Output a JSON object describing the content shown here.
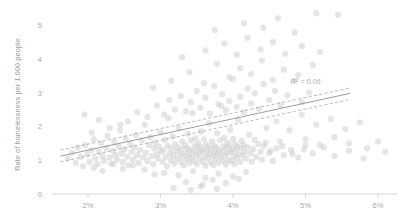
{
  "chart_data": {
    "type": "scatter",
    "title": "",
    "xlabel": "",
    "ylabel": "Rate of homelessness per 1,000 people",
    "xlim": [
      1.55,
      6.35
    ],
    "ylim": [
      0,
      5.55
    ],
    "grid": false,
    "legend": null,
    "xtick_labels": [
      "2%",
      "3%",
      "4%",
      "5%",
      "6%"
    ],
    "xtick_values": [
      2,
      3,
      4,
      5,
      6
    ],
    "ytick_labels": [
      "0",
      "1",
      "2",
      "3",
      "4",
      "5"
    ],
    "ytick_values": [
      0,
      1,
      2,
      3,
      4,
      5
    ],
    "annotations": [
      {
        "text": "R² = 0.06",
        "x": 5.0,
        "y": 3.25
      }
    ],
    "trendline": {
      "type": "linear-fit",
      "r_squared": 0.06,
      "x_start": 1.62,
      "x_end": 5.62,
      "y_start": 1.12,
      "y_end": 2.98,
      "confidence_bands": [
        {
          "name": "upper",
          "x_start": 1.62,
          "y_start": 1.3,
          "x_end": 5.62,
          "y_end": 3.14
        },
        {
          "name": "lower",
          "x_start": 1.62,
          "y_start": 0.95,
          "x_end": 5.62,
          "y_end": 2.8
        }
      ]
    },
    "marker": {
      "shape": "circle",
      "color": "#cfcfcf",
      "opacity": 0.55,
      "radius": 3.1
    },
    "points": [
      [
        1.72,
        1.05
      ],
      [
        1.78,
        1.22
      ],
      [
        1.83,
        0.92
      ],
      [
        1.86,
        1.38
      ],
      [
        1.9,
        1.1
      ],
      [
        1.93,
        0.82
      ],
      [
        1.96,
        1.45
      ],
      [
        1.99,
        1.18
      ],
      [
        2.02,
        0.95
      ],
      [
        2.05,
        1.3
      ],
      [
        2.08,
        1.62
      ],
      [
        2.1,
        1.05
      ],
      [
        2.13,
        0.88
      ],
      [
        2.15,
        1.25
      ],
      [
        2.18,
        1.5
      ],
      [
        2.2,
        1.12
      ],
      [
        2.22,
        0.98
      ],
      [
        2.25,
        1.35
      ],
      [
        2.27,
        1.72
      ],
      [
        2.3,
        1.08
      ],
      [
        2.32,
        0.9
      ],
      [
        2.34,
        1.28
      ],
      [
        2.36,
        1.55
      ],
      [
        2.38,
        1.15
      ],
      [
        2.4,
        1.02
      ],
      [
        2.42,
        1.42
      ],
      [
        2.44,
        1.88
      ],
      [
        2.46,
        1.2
      ],
      [
        2.48,
        0.95
      ],
      [
        2.5,
        1.32
      ],
      [
        2.52,
        1.65
      ],
      [
        2.54,
        1.1
      ],
      [
        2.56,
        0.85
      ],
      [
        2.58,
        1.48
      ],
      [
        2.6,
        1.25
      ],
      [
        2.62,
        1.02
      ],
      [
        2.64,
        1.38
      ],
      [
        2.66,
        1.75
      ],
      [
        2.68,
        1.15
      ],
      [
        2.7,
        0.92
      ],
      [
        2.72,
        1.3
      ],
      [
        2.74,
        1.58
      ],
      [
        2.76,
        1.08
      ],
      [
        2.78,
        2.05
      ],
      [
        2.8,
        1.22
      ],
      [
        2.82,
        0.98
      ],
      [
        2.84,
        1.45
      ],
      [
        2.86,
        1.68
      ],
      [
        2.88,
        1.12
      ],
      [
        2.9,
        0.88
      ],
      [
        2.91,
        1.35
      ],
      [
        2.93,
        1.52
      ],
      [
        2.95,
        1.18
      ],
      [
        2.96,
        1.05
      ],
      [
        2.98,
        1.4
      ],
      [
        3.0,
        1.82
      ],
      [
        3.01,
        1.25
      ],
      [
        3.03,
        0.95
      ],
      [
        3.04,
        1.3
      ],
      [
        3.06,
        1.6
      ],
      [
        3.07,
        1.1
      ],
      [
        3.09,
        0.82
      ],
      [
        3.1,
        1.42
      ],
      [
        3.11,
        2.25
      ],
      [
        3.13,
        1.2
      ],
      [
        3.14,
        1.0
      ],
      [
        3.15,
        1.35
      ],
      [
        3.17,
        1.7
      ],
      [
        3.18,
        1.15
      ],
      [
        3.19,
        0.9
      ],
      [
        3.2,
        1.48
      ],
      [
        3.22,
        1.28
      ],
      [
        3.23,
        1.05
      ],
      [
        3.24,
        1.38
      ],
      [
        3.25,
        1.95
      ],
      [
        3.27,
        1.18
      ],
      [
        3.28,
        0.95
      ],
      [
        3.29,
        1.32
      ],
      [
        3.3,
        1.55
      ],
      [
        3.31,
        1.12
      ],
      [
        3.32,
        0.85
      ],
      [
        3.34,
        1.44
      ],
      [
        3.35,
        1.22
      ],
      [
        3.36,
        1.02
      ],
      [
        3.37,
        1.36
      ],
      [
        3.38,
        1.78
      ],
      [
        3.39,
        1.14
      ],
      [
        3.4,
        0.92
      ],
      [
        3.41,
        1.3
      ],
      [
        3.42,
        1.58
      ],
      [
        3.43,
        1.08
      ],
      [
        3.44,
        2.4
      ],
      [
        3.45,
        1.25
      ],
      [
        3.46,
        0.98
      ],
      [
        3.47,
        1.42
      ],
      [
        3.48,
        1.65
      ],
      [
        3.49,
        1.16
      ],
      [
        3.5,
        0.88
      ],
      [
        3.51,
        1.34
      ],
      [
        3.52,
        1.5
      ],
      [
        3.53,
        1.2
      ],
      [
        3.54,
        1.04
      ],
      [
        3.55,
        1.4
      ],
      [
        3.56,
        1.85
      ],
      [
        3.57,
        1.24
      ],
      [
        3.58,
        0.96
      ],
      [
        3.59,
        1.31
      ],
      [
        3.6,
        1.62
      ],
      [
        3.61,
        1.11
      ],
      [
        3.62,
        0.84
      ],
      [
        3.63,
        1.46
      ],
      [
        3.64,
        1.26
      ],
      [
        3.65,
        1.06
      ],
      [
        3.66,
        1.39
      ],
      [
        3.67,
        2.1
      ],
      [
        3.68,
        1.19
      ],
      [
        3.69,
        0.94
      ],
      [
        3.7,
        1.33
      ],
      [
        3.71,
        1.56
      ],
      [
        3.72,
        1.13
      ],
      [
        3.73,
        0.86
      ],
      [
        3.74,
        1.43
      ],
      [
        3.75,
        1.23
      ],
      [
        3.76,
        1.03
      ],
      [
        3.77,
        1.37
      ],
      [
        3.78,
        1.8
      ],
      [
        3.79,
        1.17
      ],
      [
        3.8,
        0.93
      ],
      [
        3.81,
        1.29
      ],
      [
        3.82,
        1.59
      ],
      [
        3.83,
        1.09
      ],
      [
        3.84,
        2.6
      ],
      [
        3.85,
        1.27
      ],
      [
        3.86,
        0.99
      ],
      [
        3.87,
        1.41
      ],
      [
        3.88,
        1.66
      ],
      [
        3.89,
        1.15
      ],
      [
        3.9,
        0.87
      ],
      [
        3.91,
        1.35
      ],
      [
        3.92,
        1.51
      ],
      [
        3.93,
        1.21
      ],
      [
        3.94,
        1.01
      ],
      [
        3.95,
        1.45
      ],
      [
        3.96,
        1.9
      ],
      [
        3.97,
        1.25
      ],
      [
        3.98,
        0.97
      ],
      [
        3.99,
        1.32
      ],
      [
        4.0,
        1.63
      ],
      [
        4.01,
        1.12
      ],
      [
        4.02,
        0.89
      ],
      [
        4.03,
        1.47
      ],
      [
        4.04,
        1.28
      ],
      [
        4.05,
        1.07
      ],
      [
        4.06,
        1.4
      ],
      [
        4.07,
        2.2
      ],
      [
        4.08,
        1.18
      ],
      [
        4.1,
        0.95
      ],
      [
        4.11,
        1.36
      ],
      [
        4.12,
        1.57
      ],
      [
        4.13,
        1.14
      ],
      [
        4.15,
        1.44
      ],
      [
        4.16,
        1.24
      ],
      [
        4.18,
        1.05
      ],
      [
        4.2,
        1.38
      ],
      [
        4.22,
        1.75
      ],
      [
        4.24,
        1.2
      ],
      [
        4.26,
        0.96
      ],
      [
        4.28,
        1.33
      ],
      [
        4.3,
        1.6
      ],
      [
        4.32,
        1.1
      ],
      [
        4.35,
        1.48
      ],
      [
        4.38,
        1.26
      ],
      [
        4.4,
        1.02
      ],
      [
        4.43,
        1.42
      ],
      [
        4.46,
        1.95
      ],
      [
        4.5,
        1.22
      ],
      [
        4.55,
        0.98
      ],
      [
        4.6,
        1.35
      ],
      [
        4.65,
        1.55
      ],
      [
        4.7,
        1.15
      ],
      [
        4.8,
        1.3
      ],
      [
        4.9,
        1.08
      ],
      [
        5.0,
        1.45
      ],
      [
        5.1,
        1.2
      ],
      [
        5.25,
        1.38
      ],
      [
        5.4,
        1.12
      ],
      [
        5.6,
        1.28
      ],
      [
        5.8,
        1.05
      ],
      [
        2.55,
        2.15
      ],
      [
        2.68,
        2.42
      ],
      [
        2.82,
        2.28
      ],
      [
        2.95,
        2.62
      ],
      [
        3.05,
        2.35
      ],
      [
        3.12,
        2.78
      ],
      [
        3.2,
        2.5
      ],
      [
        3.28,
        2.9
      ],
      [
        3.35,
        2.45
      ],
      [
        3.42,
        2.72
      ],
      [
        3.5,
        3.05
      ],
      [
        3.55,
        2.55
      ],
      [
        3.62,
        2.85
      ],
      [
        3.68,
        2.38
      ],
      [
        3.74,
        3.2
      ],
      [
        3.8,
        2.65
      ],
      [
        3.85,
        2.95
      ],
      [
        3.9,
        2.48
      ],
      [
        3.95,
        2.75
      ],
      [
        4.0,
        3.4
      ],
      [
        4.05,
        2.58
      ],
      [
        4.1,
        2.88
      ],
      [
        4.15,
        2.42
      ],
      [
        4.2,
        3.12
      ],
      [
        4.25,
        2.68
      ],
      [
        4.3,
        2.98
      ],
      [
        4.36,
        2.52
      ],
      [
        4.42,
        3.25
      ],
      [
        4.5,
        2.78
      ],
      [
        4.58,
        3.05
      ],
      [
        4.66,
        2.62
      ],
      [
        4.75,
        2.92
      ],
      [
        4.85,
        3.35
      ],
      [
        4.95,
        2.72
      ],
      [
        5.05,
        3.0
      ],
      [
        2.9,
        3.15
      ],
      [
        3.15,
        3.35
      ],
      [
        3.4,
        3.6
      ],
      [
        3.6,
        3.28
      ],
      [
        3.78,
        3.85
      ],
      [
        3.95,
        3.45
      ],
      [
        4.1,
        3.72
      ],
      [
        4.25,
        3.55
      ],
      [
        4.4,
        3.95
      ],
      [
        4.55,
        3.38
      ],
      [
        4.7,
        3.68
      ],
      [
        4.9,
        3.52
      ],
      [
        5.1,
        3.82
      ],
      [
        3.3,
        4.05
      ],
      [
        3.62,
        4.25
      ],
      [
        3.88,
        4.45
      ],
      [
        4.05,
        4.12
      ],
      [
        4.2,
        4.62
      ],
      [
        4.38,
        4.28
      ],
      [
        4.55,
        4.5
      ],
      [
        4.72,
        4.15
      ],
      [
        4.95,
        4.38
      ],
      [
        5.2,
        4.2
      ],
      [
        3.75,
        4.85
      ],
      [
        4.15,
        5.05
      ],
      [
        4.42,
        4.92
      ],
      [
        4.62,
        5.2
      ],
      [
        4.85,
        4.78
      ],
      [
        5.15,
        5.35
      ],
      [
        5.45,
        5.3
      ],
      [
        2.45,
        2.05
      ],
      [
        2.3,
        1.95
      ],
      [
        2.15,
        2.2
      ],
      [
        2.05,
        1.82
      ],
      [
        1.95,
        2.35
      ],
      [
        4.6,
        2.15
      ],
      [
        4.78,
        1.88
      ],
      [
        4.95,
        2.35
      ],
      [
        5.15,
        2.05
      ],
      [
        5.35,
        2.22
      ],
      [
        5.55,
        1.92
      ],
      [
        5.75,
        2.12
      ],
      [
        3.05,
        0.62
      ],
      [
        3.25,
        0.55
      ],
      [
        3.45,
        0.68
      ],
      [
        3.62,
        0.48
      ],
      [
        3.8,
        0.6
      ],
      [
        4.0,
        0.52
      ],
      [
        4.18,
        0.65
      ],
      [
        3.35,
        0.35
      ],
      [
        3.58,
        0.28
      ],
      [
        3.72,
        0.42
      ],
      [
        3.9,
        0.32
      ],
      [
        4.08,
        0.45
      ],
      [
        3.18,
        0.18
      ],
      [
        3.42,
        0.12
      ],
      [
        3.55,
        0.22
      ],
      [
        3.78,
        0.15
      ],
      [
        2.78,
        0.72
      ],
      [
        2.92,
        0.58
      ],
      [
        2.62,
        0.85
      ],
      [
        2.48,
        0.75
      ],
      [
        2.35,
        0.88
      ],
      [
        2.2,
        0.68
      ],
      [
        2.08,
        0.78
      ],
      [
        5.0,
        1.62
      ],
      [
        5.2,
        1.45
      ],
      [
        5.4,
        1.68
      ],
      [
        5.6,
        1.5
      ],
      [
        5.85,
        1.35
      ],
      [
        6.0,
        1.55
      ],
      [
        6.1,
        1.25
      ],
      [
        4.45,
        1.52
      ],
      [
        4.52,
        1.28
      ],
      [
        4.68,
        1.42
      ],
      [
        4.82,
        1.18
      ],
      [
        4.98,
        1.32
      ]
    ]
  }
}
